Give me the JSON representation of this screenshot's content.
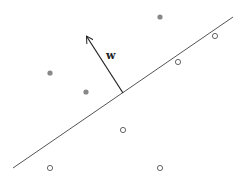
{
  "diagram": {
    "vector_label": "w",
    "colors": {
      "line": "#555555",
      "arrow": "#222222",
      "filled_point": "#888888",
      "hollow_point_stroke": "#555555"
    },
    "hyperplane": {
      "x1": 13,
      "y1": 168,
      "x2": 233,
      "y2": 17
    },
    "normal_vector": {
      "x1": 123,
      "y1": 93,
      "x2": 87,
      "y2": 37
    },
    "label_pos": {
      "x": 106,
      "y": 59
    },
    "positive_points": [
      {
        "x": 160,
        "y": 17
      },
      {
        "x": 50,
        "y": 73
      },
      {
        "x": 86,
        "y": 92
      }
    ],
    "negative_points": [
      {
        "x": 215,
        "y": 36
      },
      {
        "x": 178,
        "y": 62
      },
      {
        "x": 123,
        "y": 130
      },
      {
        "x": 50,
        "y": 168
      },
      {
        "x": 160,
        "y": 168
      }
    ]
  }
}
